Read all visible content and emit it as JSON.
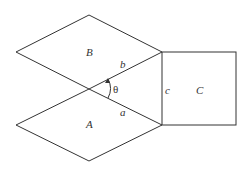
{
  "diagram": {
    "type": "geometric figure: two rhombi and a square",
    "shapes": [
      {
        "id": "rhombus-B",
        "label": "B"
      },
      {
        "id": "rhombus-A",
        "label": "A"
      },
      {
        "id": "square-C",
        "label": "C"
      }
    ],
    "side_labels": {
      "b": "b",
      "a": "a",
      "c": "c"
    },
    "angle_label": "θ",
    "colors": {
      "stroke": "#333333",
      "background": "#ffffff"
    }
  }
}
